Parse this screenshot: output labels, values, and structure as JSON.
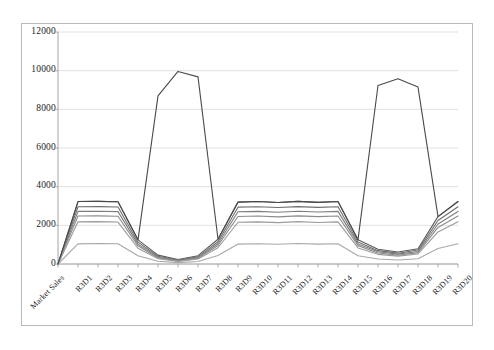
{
  "chart_data": {
    "type": "line",
    "title": "",
    "subtitle": "",
    "xlabel": "",
    "ylabel": "",
    "ylim": [
      0,
      12000
    ],
    "yticks": [
      0,
      2000,
      4000,
      6000,
      8000,
      10000,
      12000
    ],
    "ytick_labels": [
      "0",
      "2000",
      "4000",
      "6000",
      "8000",
      "10000",
      "12000"
    ],
    "grid": "horizontal",
    "legend": "none",
    "categories": [
      "Market Sales",
      "R3D1",
      "R3D2",
      "R3D3",
      "R3D4",
      "R3D5",
      "R3D6",
      "R3D7",
      "R3D8",
      "R3D9",
      "R3D10",
      "R3D11",
      "R3D12",
      "R3D13",
      "R3D14",
      "R3D15",
      "R3D16",
      "R3D17",
      "R3D18",
      "R3D19",
      "R3D20"
    ],
    "series": [
      {
        "name": "series-1",
        "color": "#5a5a5a",
        "values": [
          0,
          3230,
          3240,
          3220,
          1250,
          460,
          230,
          430,
          1280,
          3200,
          3230,
          3180,
          3240,
          3190,
          3230,
          1260,
          760,
          620,
          790,
          2450,
          3230
        ]
      },
      {
        "name": "series-2",
        "color": "#6e6e6e",
        "values": [
          0,
          2960,
          2970,
          2950,
          1130,
          400,
          200,
          370,
          1150,
          2940,
          2960,
          2920,
          2970,
          2930,
          2960,
          1140,
          690,
          560,
          720,
          2250,
          2960
        ]
      },
      {
        "name": "series-3",
        "color": "#7d7d7d",
        "values": [
          0,
          2720,
          2730,
          2710,
          1030,
          350,
          175,
          330,
          1050,
          2700,
          2720,
          2680,
          2730,
          2690,
          2720,
          1040,
          630,
          510,
          650,
          2070,
          2720
        ]
      },
      {
        "name": "series-4",
        "color": "#8c8c8c",
        "values": [
          0,
          2480,
          2490,
          2470,
          940,
          310,
          155,
          290,
          960,
          2460,
          2480,
          2440,
          2490,
          2450,
          2480,
          950,
          570,
          460,
          590,
          1890,
          2480
        ]
      },
      {
        "name": "series-5",
        "color": "#9b9b9b",
        "values": [
          0,
          2180,
          2190,
          2170,
          820,
          270,
          135,
          255,
          840,
          2160,
          2180,
          2140,
          2190,
          2150,
          2180,
          830,
          500,
          405,
          520,
          1660,
          2180
        ]
      },
      {
        "name": "series-6",
        "color": "#a8a8a8",
        "values": [
          0,
          1040,
          1060,
          1050,
          430,
          140,
          70,
          130,
          440,
          1030,
          1050,
          1020,
          1060,
          1030,
          1050,
          430,
          260,
          210,
          270,
          800,
          1050
        ]
      },
      {
        "name": "series-spike",
        "color": "#4a4a4a",
        "values": [
          0,
          3230,
          3240,
          3220,
          1250,
          8700,
          9960,
          9680,
          1280,
          3200,
          3230,
          3180,
          3240,
          3190,
          3230,
          1260,
          9230,
          9580,
          9150,
          2450,
          3230
        ]
      }
    ],
    "notes": {
      "peak_left_label": "R3D6",
      "peak_left_value": 9960,
      "peak_right_label": "R3D17",
      "peak_right_value": 9580
    }
  },
  "frame": {
    "border_color": "#b9b9b9",
    "grid_color": "#d9d9d9",
    "axis_color": "#9a9a9a",
    "text_color": "#1d1d1d"
  }
}
